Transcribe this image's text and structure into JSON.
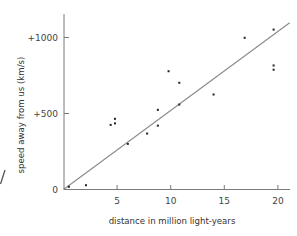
{
  "chart_data": {
    "type": "scatter",
    "title": "",
    "xlabel": "distance in million light-years",
    "ylabel": "speed away from us (km/s)",
    "xlim": [
      0,
      21
    ],
    "ylim": [
      0,
      1100
    ],
    "x_ticks": [
      5,
      10,
      15,
      20
    ],
    "x_tick_labels": [
      "5",
      "10",
      "15",
      "20"
    ],
    "y_ticks": [
      0,
      500,
      1000
    ],
    "y_tick_labels": [
      "0",
      "+500",
      "+1000"
    ],
    "grid": false,
    "legend": null,
    "series": [
      {
        "name": "galaxies",
        "points": [
          {
            "x": 0.5,
            "y": 18
          },
          {
            "x": 2.1,
            "y": 28
          },
          {
            "x": 4.4,
            "y": 425
          },
          {
            "x": 4.8,
            "y": 465
          },
          {
            "x": 4.8,
            "y": 435
          },
          {
            "x": 6.0,
            "y": 300
          },
          {
            "x": 7.8,
            "y": 368
          },
          {
            "x": 8.8,
            "y": 524
          },
          {
            "x": 8.8,
            "y": 420
          },
          {
            "x": 9.8,
            "y": 778
          },
          {
            "x": 10.8,
            "y": 702
          },
          {
            "x": 10.8,
            "y": 559
          },
          {
            "x": 14.0,
            "y": 625
          },
          {
            "x": 16.9,
            "y": 998
          },
          {
            "x": 19.6,
            "y": 1052
          },
          {
            "x": 19.6,
            "y": 816
          },
          {
            "x": 19.6,
            "y": 788
          }
        ]
      }
    ],
    "fit_line": {
      "name": "best-fit line",
      "x0": 0,
      "y0": 0,
      "x1": 21.1,
      "y1": 1097,
      "slope": 52
    }
  },
  "colors": {
    "axis": "#7a7a7a",
    "fit_line": "#8a8a8a",
    "points": "#222222",
    "text": "#333333",
    "background": "#ffffff"
  }
}
